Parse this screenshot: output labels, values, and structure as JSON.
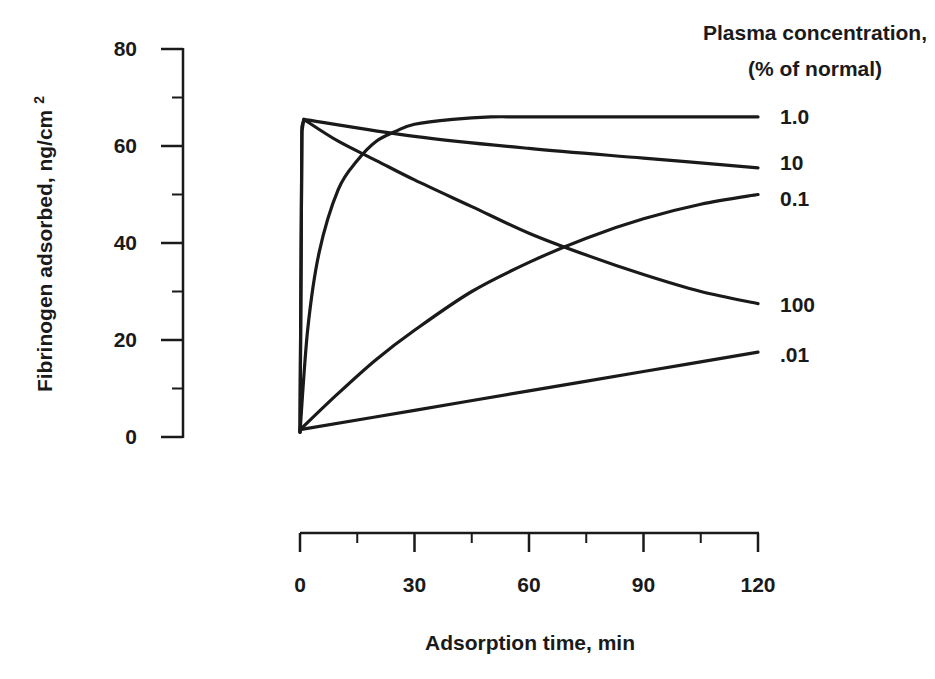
{
  "chart_data": {
    "type": "line",
    "title": "",
    "xlabel": "Adsorption time, min",
    "ylabel": "Fibrinogen adsorbed, ng/cm 2",
    "ylabel_main": "Fibrinogen adsorbed, ng/cm",
    "ylabel_sup": "2",
    "xlim": [
      0,
      120
    ],
    "ylim": [
      0,
      80
    ],
    "xticks": [
      0,
      30,
      60,
      90,
      120
    ],
    "xtick_labels": [
      "0",
      "30",
      "60",
      "90",
      "120"
    ],
    "xminor": [
      15,
      45,
      75,
      105
    ],
    "yticks": [
      0,
      20,
      40,
      60,
      80
    ],
    "ytick_labels": [
      "0",
      "20",
      "40",
      "60",
      "80"
    ],
    "yminor": [
      10,
      30,
      50,
      70
    ],
    "grid": false,
    "legend_title_line1": "Plasma concentration,",
    "legend_title_line2": "(% of normal)",
    "legend_position": "right, labels at curve ends",
    "series": [
      {
        "name": "1.0",
        "x": [
          0,
          2,
          5,
          10,
          15,
          20,
          25,
          30,
          40,
          50,
          60,
          90,
          120
        ],
        "values": [
          1,
          22,
          38,
          51,
          57,
          61,
          63,
          64.5,
          65.5,
          66,
          66,
          66,
          66
        ]
      },
      {
        "name": "10",
        "x": [
          0,
          0.5,
          1,
          30,
          60,
          90,
          120
        ],
        "values": [
          1,
          64,
          65.5,
          62,
          59.5,
          57.5,
          55.5
        ]
      },
      {
        "name": "0.1",
        "x": [
          0,
          10,
          20,
          30,
          45,
          60,
          75,
          90,
          105,
          120
        ],
        "values": [
          1.5,
          9,
          16,
          22,
          30,
          36,
          41,
          45,
          48,
          50
        ]
      },
      {
        "name": "100",
        "x": [
          0,
          0.5,
          1,
          10,
          20,
          30,
          45,
          60,
          75,
          90,
          105,
          120
        ],
        "values": [
          1,
          63,
          65.5,
          61,
          57,
          53,
          47.5,
          42,
          37.5,
          33.5,
          30,
          27.5
        ]
      },
      {
        "name": ".01",
        "x": [
          0,
          30,
          60,
          90,
          120
        ],
        "values": [
          1.5,
          5.5,
          9.5,
          13.5,
          17.5
        ]
      }
    ]
  }
}
